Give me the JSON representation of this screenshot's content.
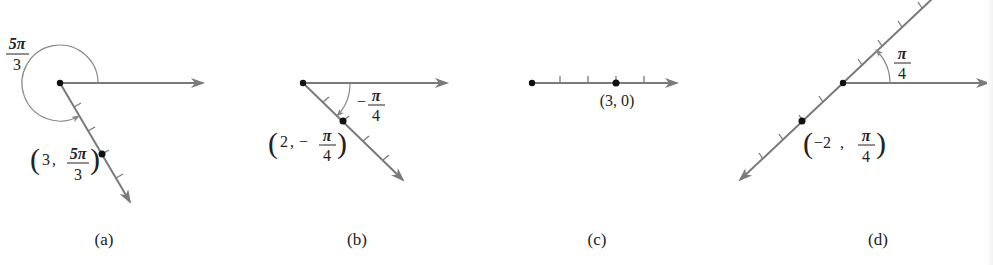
{
  "figure": {
    "colors": {
      "line": "#7a7a7a",
      "point": "#111111",
      "text": "#222222",
      "arc": "#888888"
    },
    "panels": [
      {
        "id": "a",
        "caption": "(a)",
        "angle_label": {
          "num": "5π",
          "den": "3",
          "sign": ""
        },
        "point_label": {
          "r": "3",
          "num": "5π",
          "den": "3",
          "sign": ""
        },
        "r": 3,
        "theta": "5π/3"
      },
      {
        "id": "b",
        "caption": "(b)",
        "angle_label": {
          "num": "π",
          "den": "4",
          "sign": "−"
        },
        "point_label": {
          "r": "2",
          "num": "π",
          "den": "4",
          "sign": "−"
        },
        "r": 2,
        "theta": "-π/4"
      },
      {
        "id": "c",
        "caption": "(c)",
        "point_label": {
          "text": "(3, 0)"
        },
        "r": 3,
        "theta": "0"
      },
      {
        "id": "d",
        "caption": "(d)",
        "angle_label": {
          "num": "π",
          "den": "4",
          "sign": ""
        },
        "point_label": {
          "r": "−2",
          "num": "π",
          "den": "4",
          "sign": ""
        },
        "r": -2,
        "theta": "π/4"
      }
    ]
  }
}
